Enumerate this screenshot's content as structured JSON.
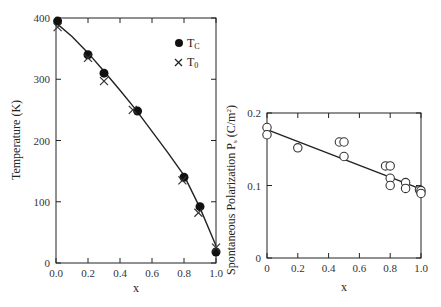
{
  "chart_data": [
    {
      "type": "scatter",
      "title": "",
      "xlabel": "x",
      "ylabel": "Temperature (K)",
      "xlim": [
        0.0,
        1.0
      ],
      "ylim": [
        0,
        400
      ],
      "xticks": [
        "0.0",
        "0.2",
        "0.4",
        "0.6",
        "0.8",
        "1.0"
      ],
      "yticks": [
        "0",
        "100",
        "200",
        "300",
        "400"
      ],
      "grid": false,
      "legend_position": "upper right",
      "series": [
        {
          "name": "T_C",
          "label_main": "T",
          "label_sub": "C",
          "marker": "filled-circle",
          "x": [
            0.01,
            0.2,
            0.3,
            0.51,
            0.8,
            0.9,
            1.0
          ],
          "y": [
            395,
            340,
            310,
            248,
            140,
            92,
            18
          ]
        },
        {
          "name": "T_0",
          "label_main": "T",
          "label_sub": "0",
          "marker": "x",
          "x": [
            0.01,
            0.2,
            0.3,
            0.48,
            0.79,
            0.89,
            1.0
          ],
          "y": [
            385,
            335,
            297,
            250,
            135,
            82,
            25
          ]
        },
        {
          "name": "fit",
          "marker": "line",
          "x": [
            0.0,
            0.1,
            0.2,
            0.3,
            0.4,
            0.5,
            0.6,
            0.7,
            0.8,
            0.9,
            1.0
          ],
          "y": [
            392,
            370,
            343,
            313,
            282,
            250,
            215,
            180,
            143,
            90,
            28
          ]
        }
      ]
    },
    {
      "type": "scatter",
      "title": "",
      "xlabel": "x",
      "ylabel": "Spontaneous Polarization P's (C/m²)",
      "ylabel_parts": {
        "main": "Spontaneous Polarization P",
        "prime": "′",
        "sub": "s",
        "units": "(C/m²)"
      },
      "xlim": [
        0,
        1.0
      ],
      "ylim": [
        0,
        0.2
      ],
      "xticks": [
        "0",
        "0.2",
        "0.4",
        "0.6",
        "0.8",
        "1.0"
      ],
      "yticks": [
        "0",
        "0.1",
        "0.2"
      ],
      "grid": false,
      "series": [
        {
          "name": "P's data",
          "marker": "open-circle",
          "x": [
            0.0,
            0.0,
            0.2,
            0.47,
            0.5,
            0.5,
            0.77,
            0.8,
            0.8,
            0.8,
            0.9,
            0.9,
            0.99,
            1.0,
            1.0
          ],
          "y": [
            0.18,
            0.17,
            0.152,
            0.16,
            0.16,
            0.14,
            0.127,
            0.127,
            0.11,
            0.1,
            0.104,
            0.096,
            0.094,
            0.093,
            0.089
          ]
        },
        {
          "name": "linear fit",
          "marker": "line",
          "x": [
            0.0,
            1.0
          ],
          "y": [
            0.177,
            0.095
          ]
        }
      ]
    }
  ],
  "left": {
    "ylabel": "Temperature (K)",
    "xlabel": "x",
    "legend": {
      "tc_main": "T",
      "tc_sub": "C",
      "t0_main": "T",
      "t0_sub": "0"
    }
  },
  "right": {
    "ylabel_main": "Spontaneous Polarization  P",
    "ylabel_sub": "s",
    "ylabel_units": "(C/m",
    "ylabel_sup": "2",
    "ylabel_close": ")",
    "xlabel": "x"
  }
}
